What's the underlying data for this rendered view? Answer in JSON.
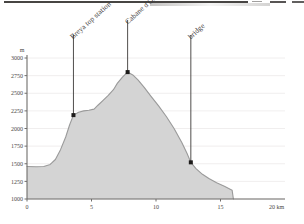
{
  "figure": {
    "kind": "elevation-profile",
    "artifact": "scanned-page-top-streak"
  },
  "axes": {
    "y_unit": "m",
    "x_unit": "20 km",
    "y_ticks": [
      "1000",
      "1250",
      "1500",
      "1750",
      "2000",
      "2250",
      "2500",
      "2750",
      "3000"
    ],
    "x_ticks": [
      "0",
      "5",
      "10",
      "15"
    ]
  },
  "annotations": [
    {
      "label": "Breya top station",
      "km": 3.6,
      "m": 2190
    },
    {
      "label": "Cabane d'Orny",
      "km": 7.8,
      "m": 2800
    },
    {
      "label": "bridge",
      "km": 12.7,
      "m": 1520
    }
  ],
  "colors": {
    "fill": "#d4d4d4",
    "profile_line": "#9a9a9a",
    "axis": "#6f6d6b",
    "gridline": "#eceaea",
    "marker": "#1d1b1a",
    "leader": "#3c3a38",
    "text": "#3b3835"
  },
  "chart_data": {
    "type": "area",
    "title": "",
    "xlabel": "20 km",
    "ylabel": "m",
    "xlim": [
      0,
      20
    ],
    "ylim": [
      1000,
      3000
    ],
    "grid": true,
    "legend": "none",
    "x_ticks": [
      0,
      5,
      10,
      15,
      20
    ],
    "y_ticks": [
      1000,
      1250,
      1500,
      1750,
      2000,
      2250,
      2500,
      2750,
      3000
    ],
    "series": [
      {
        "name": "elevation profile",
        "x": [
          0.0,
          0.7,
          1.3,
          1.8,
          2.2,
          2.6,
          3.0,
          3.3,
          3.6,
          4.0,
          4.4,
          4.8,
          5.2,
          5.5,
          5.9,
          6.3,
          6.7,
          7.0,
          7.4,
          7.8,
          8.2,
          8.6,
          9.1,
          9.6,
          10.2,
          10.8,
          11.4,
          12.0,
          12.4,
          12.7,
          13.1,
          13.6,
          14.1,
          14.7,
          15.3,
          15.9,
          16.0
        ],
        "y": [
          1460,
          1458,
          1462,
          1490,
          1560,
          1700,
          1880,
          2050,
          2190,
          2230,
          2250,
          2258,
          2275,
          2330,
          2400,
          2470,
          2550,
          2640,
          2730,
          2800,
          2760,
          2690,
          2580,
          2460,
          2320,
          2170,
          2000,
          1800,
          1650,
          1520,
          1430,
          1350,
          1290,
          1230,
          1180,
          1125,
          1000
        ]
      }
    ],
    "annotations": [
      {
        "label": "Breya top station",
        "x": 3.6,
        "y": 2190
      },
      {
        "label": "Cabane d'Orny",
        "x": 7.8,
        "y": 2800
      },
      {
        "label": "bridge",
        "x": 12.7,
        "y": 1520
      }
    ]
  }
}
